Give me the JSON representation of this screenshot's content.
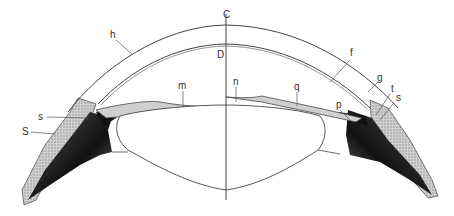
{
  "figure": {
    "colors": {
      "line": "#444444",
      "stipple": "#9a9a9a",
      "dark": "#1a1a1a",
      "background": "#ffffff"
    },
    "labels": [
      {
        "id": "C",
        "text": "C",
        "x": 223,
        "y": 14
      },
      {
        "id": "D",
        "text": "D",
        "x": 217,
        "y": 50
      },
      {
        "id": "h",
        "text": "h",
        "x": 111,
        "y": 34
      },
      {
        "id": "f",
        "text": "f",
        "x": 352,
        "y": 56
      },
      {
        "id": "g",
        "text": "g",
        "x": 380,
        "y": 76
      },
      {
        "id": "t",
        "text": "t",
        "x": 392,
        "y": 88
      },
      {
        "id": "s_right",
        "text": "s",
        "x": 396,
        "y": 97
      },
      {
        "id": "p",
        "text": "p",
        "x": 336,
        "y": 104
      },
      {
        "id": "q",
        "text": "q",
        "x": 295,
        "y": 84
      },
      {
        "id": "n",
        "text": "n",
        "x": 234,
        "y": 79
      },
      {
        "id": "m",
        "text": "m",
        "x": 180,
        "y": 83
      },
      {
        "id": "s_left",
        "text": "s",
        "x": 40,
        "y": 113
      },
      {
        "id": "S",
        "text": "S",
        "x": 24,
        "y": 127
      }
    ]
  }
}
